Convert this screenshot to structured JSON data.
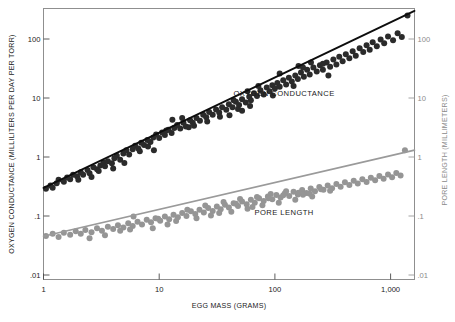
{
  "chart_data": {
    "type": "scatter",
    "title": "",
    "xlabel": "EGG MASS (GRAMS)",
    "ylabel": "OXYGEN CONDUCTANCE (MILLILITERS PER DAY PER TORR)",
    "y2label": "PORE LENGTH (MILLIMETERS)",
    "xscale": "log",
    "yscale": "log",
    "y2scale": "log",
    "grid": false,
    "xlim": [
      1,
      1700
    ],
    "ylim": [
      0.01,
      300
    ],
    "y2lim": [
      0.01,
      300
    ],
    "xticks": [
      1,
      10,
      100,
      1000
    ],
    "xtick_labels": [
      "1",
      "10",
      "100",
      "1,000"
    ],
    "yticks": [
      100,
      10,
      1,
      0.1,
      0.01
    ],
    "ytick_labels": [
      "100",
      "10",
      "1",
      ".1",
      ".01"
    ],
    "y2ticks": [
      100,
      10,
      1,
      0.1,
      0.01
    ],
    "y2tick_labels": [
      "100",
      "10",
      "1",
      ".1",
      ".01"
    ],
    "legend_position": "inline-annotations",
    "annotations": [
      {
        "text": "OXYGEN CONDUCTANCE",
        "x": 120,
        "y": 11,
        "color": "#1a1a1a"
      },
      {
        "text": "PORE LENGTH",
        "x": 120,
        "y": 0.105,
        "color": "#1a1a1a"
      }
    ],
    "series": [
      {
        "name": "OXYGEN CONDUCTANCE",
        "color": "#2b2b2b",
        "marker": "circle",
        "marker_size": 3.0,
        "fit_line": {
          "intercept_at_x1": 0.3,
          "slope": 0.935,
          "color": "#0d0d0d",
          "width": 1.9
        },
        "points": [
          [
            1.05,
            0.29
          ],
          [
            1.15,
            0.33
          ],
          [
            1.2,
            0.3
          ],
          [
            1.3,
            0.36
          ],
          [
            1.35,
            0.41
          ],
          [
            1.5,
            0.38
          ],
          [
            1.6,
            0.45
          ],
          [
            1.7,
            0.42
          ],
          [
            1.8,
            0.5
          ],
          [
            1.95,
            0.47
          ],
          [
            2.1,
            0.55
          ],
          [
            2.2,
            0.5
          ],
          [
            2.4,
            0.6
          ],
          [
            2.5,
            0.53
          ],
          [
            2.7,
            0.67
          ],
          [
            2.9,
            0.62
          ],
          [
            3.1,
            0.72
          ],
          [
            3.3,
            0.8
          ],
          [
            3.4,
            0.7
          ],
          [
            3.6,
            0.85
          ],
          [
            3.9,
            0.78
          ],
          [
            4.1,
            0.95
          ],
          [
            4.3,
            1.05
          ],
          [
            4.6,
            0.9
          ],
          [
            4.9,
            1.15
          ],
          [
            5.2,
            1.3
          ],
          [
            5.5,
            1.1
          ],
          [
            5.9,
            1.35
          ],
          [
            6.2,
            1.55
          ],
          [
            6.6,
            1.4
          ],
          [
            7.0,
            1.75
          ],
          [
            7.4,
            1.6
          ],
          [
            7.9,
            1.95
          ],
          [
            8.4,
            1.8
          ],
          [
            8.9,
            2.15
          ],
          [
            9.4,
            2.4
          ],
          [
            10.0,
            2.1
          ],
          [
            10.6,
            2.6
          ],
          [
            11.2,
            2.35
          ],
          [
            12.0,
            2.9
          ],
          [
            12.8,
            2.55
          ],
          [
            13.5,
            3.1
          ],
          [
            14.3,
            3.5
          ],
          [
            15.2,
            3.05
          ],
          [
            16.2,
            3.8
          ],
          [
            17.0,
            3.3
          ],
          [
            18.5,
            4.2
          ],
          [
            19.5,
            3.8
          ],
          [
            21.0,
            4.6
          ],
          [
            22.5,
            4.1
          ],
          [
            24.0,
            5.2
          ],
          [
            25.5,
            4.7
          ],
          [
            27.0,
            5.8
          ],
          [
            29.0,
            5.2
          ],
          [
            31.0,
            6.4
          ],
          [
            33.0,
            5.7
          ],
          [
            35.0,
            7.0
          ],
          [
            38.0,
            6.3
          ],
          [
            40.0,
            7.8
          ],
          [
            43.0,
            7.0
          ],
          [
            46.0,
            8.6
          ],
          [
            49.0,
            7.6
          ],
          [
            52.0,
            9.5
          ],
          [
            56.0,
            8.4
          ],
          [
            60.0,
            10.5
          ],
          [
            62.0,
            9.2
          ],
          [
            66.0,
            12.0
          ],
          [
            70.0,
            10.8
          ],
          [
            75.0,
            13.5
          ],
          [
            80.0,
            11.5
          ],
          [
            85.0,
            15.0
          ],
          [
            90.0,
            13.0
          ],
          [
            95.0,
            16.5
          ],
          [
            100.0,
            14.5
          ],
          [
            105.0,
            18.0
          ],
          [
            110.0,
            15.5
          ],
          [
            118.0,
            20.0
          ],
          [
            125.0,
            17.0
          ],
          [
            132.0,
            22.0
          ],
          [
            140.0,
            19.0
          ],
          [
            150.0,
            24.0
          ],
          [
            158.0,
            21.0
          ],
          [
            168.0,
            27.0
          ],
          [
            178.0,
            23.0
          ],
          [
            190.0,
            30.0
          ],
          [
            200.0,
            25.0
          ],
          [
            215.0,
            33.0
          ],
          [
            230.0,
            28.0
          ],
          [
            245.0,
            36.0
          ],
          [
            260.0,
            30.0
          ],
          [
            280.0,
            40.0
          ],
          [
            300.0,
            34.0
          ],
          [
            320.0,
            45.0
          ],
          [
            340.0,
            37.0
          ],
          [
            360.0,
            50.0
          ],
          [
            385.0,
            42.0
          ],
          [
            410.0,
            55.0
          ],
          [
            440.0,
            47.0
          ],
          [
            470.0,
            62.0
          ],
          [
            500.0,
            52.0
          ],
          [
            540.0,
            70.0
          ],
          [
            580.0,
            60.0
          ],
          [
            620.0,
            78.0
          ],
          [
            660.0,
            66.0
          ],
          [
            700.0,
            88.0
          ],
          [
            760.0,
            75.0
          ],
          [
            820.0,
            98.0
          ],
          [
            880.0,
            85.0
          ],
          [
            950.0,
            110.0
          ],
          [
            1050.0,
            95.0
          ],
          [
            1150.0,
            125.0
          ],
          [
            1250.0,
            108.0
          ],
          [
            1400.0,
            250.0
          ],
          [
            13.0,
            4.3
          ],
          [
            15.8,
            4.6
          ],
          [
            18.0,
            3.2
          ],
          [
            40.5,
            5.1
          ],
          [
            52.0,
            6.1
          ],
          [
            58.0,
            13.0
          ],
          [
            61.0,
            7.3
          ],
          [
            72.0,
            16.0
          ],
          [
            96.0,
            11.0
          ],
          [
            110.0,
            26.0
          ],
          [
            145.0,
            16.0
          ],
          [
            160.0,
            35.0
          ],
          [
            175.0,
            33.0
          ],
          [
            205.0,
            40.0
          ],
          [
            260.0,
            38.0
          ],
          [
            290.0,
            24.0
          ],
          [
            6.8,
            1.25
          ],
          [
            8.0,
            1.5
          ],
          [
            9.0,
            1.3
          ],
          [
            11.5,
            2.8
          ],
          [
            20.0,
            3.4
          ],
          [
            26.0,
            4.0
          ],
          [
            33.5,
            4.8
          ],
          [
            44.0,
            9.2
          ],
          [
            48.0,
            6.5
          ],
          [
            2.0,
            0.41
          ],
          [
            2.6,
            0.46
          ],
          [
            3.0,
            0.58
          ],
          [
            4.0,
            0.64
          ],
          [
            5.0,
            0.79
          ]
        ]
      },
      {
        "name": "PORE LENGTH",
        "color": "#959595",
        "marker": "circle",
        "marker_size": 3.0,
        "fit_line": {
          "intercept_at_x1": 0.0455,
          "slope": 0.455,
          "color": "#9a9a9a",
          "width": 1.6
        },
        "points": [
          [
            1.05,
            0.046
          ],
          [
            1.2,
            0.05
          ],
          [
            1.35,
            0.044
          ],
          [
            1.5,
            0.052
          ],
          [
            1.7,
            0.048
          ],
          [
            1.9,
            0.055
          ],
          [
            2.1,
            0.05
          ],
          [
            2.3,
            0.058
          ],
          [
            2.6,
            0.053
          ],
          [
            2.9,
            0.062
          ],
          [
            3.2,
            0.056
          ],
          [
            3.6,
            0.066
          ],
          [
            4.0,
            0.06
          ],
          [
            4.4,
            0.07
          ],
          [
            4.9,
            0.064
          ],
          [
            5.4,
            0.075
          ],
          [
            5.9,
            0.068
          ],
          [
            6.5,
            0.08
          ],
          [
            7.1,
            0.072
          ],
          [
            7.8,
            0.086
          ],
          [
            8.5,
            0.078
          ],
          [
            9.3,
            0.092
          ],
          [
            10.2,
            0.083
          ],
          [
            11.2,
            0.098
          ],
          [
            12.2,
            0.088
          ],
          [
            13.3,
            0.105
          ],
          [
            14.5,
            0.095
          ],
          [
            15.8,
            0.112
          ],
          [
            17.2,
            0.1
          ],
          [
            18.8,
            0.12
          ],
          [
            20.5,
            0.108
          ],
          [
            22.3,
            0.128
          ],
          [
            24.3,
            0.115
          ],
          [
            26.5,
            0.136
          ],
          [
            29.0,
            0.122
          ],
          [
            31.5,
            0.145
          ],
          [
            34.0,
            0.13
          ],
          [
            37.0,
            0.155
          ],
          [
            40.0,
            0.14
          ],
          [
            44.0,
            0.165
          ],
          [
            48.0,
            0.148
          ],
          [
            52.0,
            0.176
          ],
          [
            57.0,
            0.158
          ],
          [
            62.0,
            0.188
          ],
          [
            67.0,
            0.168
          ],
          [
            73.0,
            0.2
          ],
          [
            80.0,
            0.18
          ],
          [
            87.0,
            0.215
          ],
          [
            95.0,
            0.192
          ],
          [
            103.0,
            0.228
          ],
          [
            112.0,
            0.205
          ],
          [
            122.0,
            0.243
          ],
          [
            133.0,
            0.218
          ],
          [
            145.0,
            0.258
          ],
          [
            158.0,
            0.232
          ],
          [
            172.0,
            0.275
          ],
          [
            187.0,
            0.246
          ],
          [
            204.0,
            0.292
          ],
          [
            222.0,
            0.262
          ],
          [
            242.0,
            0.31
          ],
          [
            263.0,
            0.278
          ],
          [
            286.0,
            0.33
          ],
          [
            312.0,
            0.295
          ],
          [
            340.0,
            0.35
          ],
          [
            370.0,
            0.314
          ],
          [
            403.0,
            0.372
          ],
          [
            440.0,
            0.334
          ],
          [
            480.0,
            0.396
          ],
          [
            520.0,
            0.355
          ],
          [
            570.0,
            0.42
          ],
          [
            620.0,
            0.378
          ],
          [
            675.0,
            0.447
          ],
          [
            735.0,
            0.402
          ],
          [
            800.0,
            0.475
          ],
          [
            870.0,
            0.428
          ],
          [
            950.0,
            0.505
          ],
          [
            1030.0,
            0.455
          ],
          [
            1120.0,
            0.538
          ],
          [
            1220.0,
            0.485
          ],
          [
            1330.0,
            1.3
          ],
          [
            6.0,
            0.098
          ],
          [
            8.8,
            0.062
          ],
          [
            11.8,
            0.072
          ],
          [
            14.0,
            0.082
          ],
          [
            17.5,
            0.128
          ],
          [
            21.0,
            0.092
          ],
          [
            25.0,
            0.15
          ],
          [
            28.0,
            0.102
          ],
          [
            36.0,
            0.172
          ],
          [
            42.0,
            0.118
          ],
          [
            50.0,
            0.195
          ],
          [
            58.0,
            0.133
          ],
          [
            70.0,
            0.21
          ],
          [
            78.0,
            0.152
          ],
          [
            92.0,
            0.235
          ],
          [
            108.0,
            0.168
          ],
          [
            125.0,
            0.262
          ],
          [
            150.0,
            0.188
          ],
          [
            175.0,
            0.23
          ],
          [
            210.0,
            0.215
          ],
          [
            2.5,
            0.042
          ],
          [
            3.4,
            0.047
          ],
          [
            4.6,
            0.056
          ],
          [
            5.6,
            0.059
          ],
          [
            9.8,
            0.09
          ],
          [
            33.0,
            0.112
          ],
          [
            46.0,
            0.162
          ],
          [
            64.0,
            0.142
          ],
          [
            88.0,
            0.2
          ],
          [
            118.0,
            0.225
          ],
          [
            160.0,
            0.248
          ],
          [
            200.0,
            0.238
          ],
          [
            250.0,
            0.285
          ],
          [
            300.0,
            0.268
          ]
        ]
      }
    ]
  },
  "figure": {
    "background": "#ffffff",
    "frame_color": "#8f8f8f",
    "black_series_color": "#2b2b2b",
    "gray_series_color": "#959595"
  }
}
